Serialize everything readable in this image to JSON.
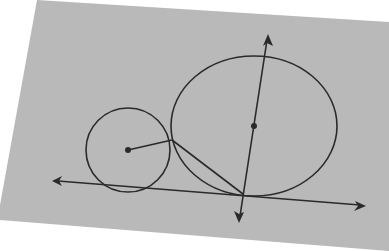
{
  "diagram": {
    "colors": {
      "background": "#ffffff",
      "paper": "#b9b9b9",
      "ink": "#2a2a2a"
    },
    "paper_polygon": "37,0 389,22 389,251 0,220 0,205",
    "small_circle": {
      "cx": 128,
      "cy": 150,
      "r": 42,
      "center_dot_r": 3
    },
    "large_circle": {
      "cx": 254,
      "cy": 126,
      "rx": 83,
      "ry": 70,
      "center_dot_r": 3
    },
    "tangent_line": {
      "x1": 58,
      "y1": 181,
      "x2": 360,
      "y2": 205
    },
    "tangent_arrow_left": "52,181 62,176 59,181 62,186",
    "tangent_arrow_right": "366,206 355,201 358,206 354,211",
    "perpendicular_line": {
      "x1": 267,
      "y1": 40,
      "x2": 240,
      "y2": 216
    },
    "perpendicular_arrow_top": "268,34 263,46 267,43 273,46",
    "perpendicular_arrow_bottom": "239,223 234,211 239,214 244,212",
    "radius_segment": {
      "x1": 128,
      "y1": 150,
      "x2": 172,
      "y2": 140
    },
    "chord_segment": {
      "x1": 172,
      "y1": 140,
      "x2": 243,
      "y2": 194
    },
    "labels": []
  }
}
